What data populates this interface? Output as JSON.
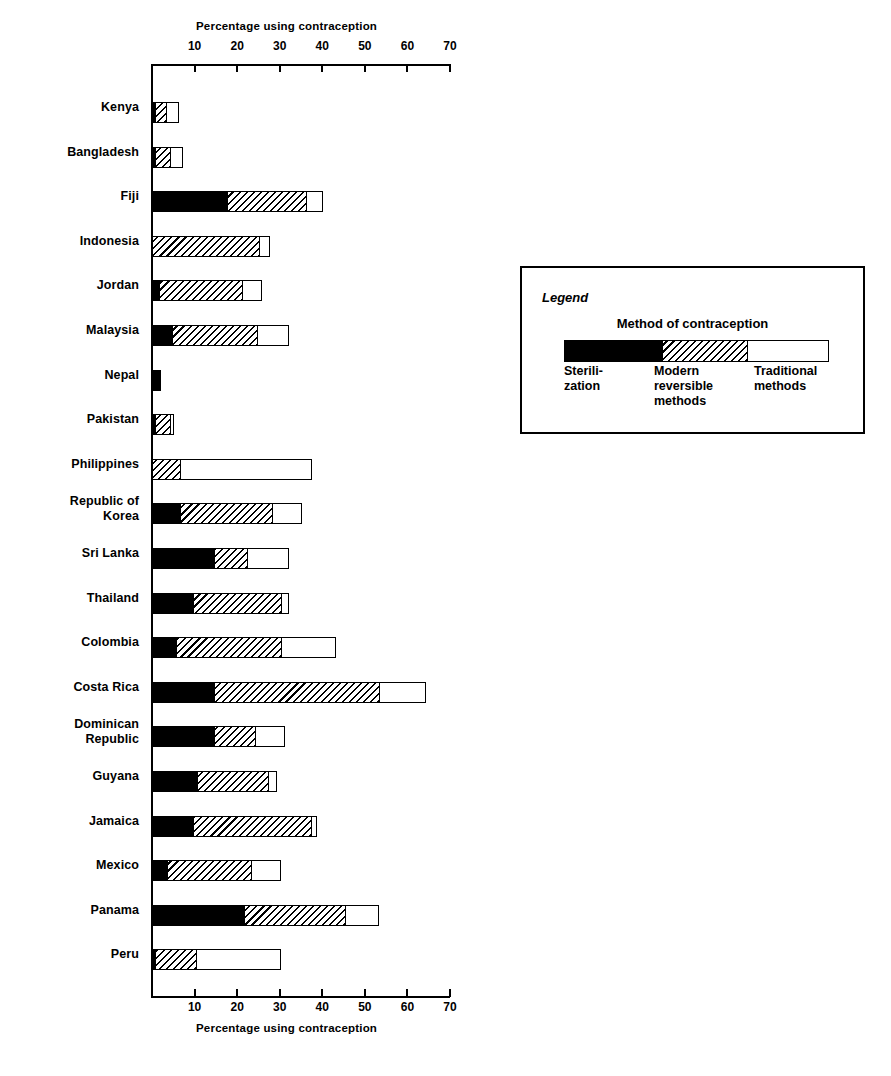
{
  "chart_data": {
    "type": "bar",
    "orientation": "horizontal",
    "stacked": true,
    "title": "",
    "xlabel": "Percentage using contraception",
    "ylabel": "",
    "xlim": [
      0,
      70
    ],
    "xticks": [
      10,
      20,
      30,
      40,
      50,
      60,
      70
    ],
    "grid": false,
    "axis_top_label": "Percentage using contraception",
    "axis_bottom_label": "Percentage using contraception",
    "categories": [
      "Kenya",
      "Bangladesh",
      "Fiji",
      "Indonesia",
      "Jordan",
      "Malaysia",
      "Nepal",
      "Pakistan",
      "Philippines",
      "Republic of\nKorea",
      "Sri Lanka",
      "Thailand",
      "Colombia",
      "Costa Rica",
      "Dominican\nRepublic",
      "Guyana",
      "Jamaica",
      "Mexico",
      "Panama",
      "Peru"
    ],
    "series": [
      {
        "name": "Sterilization",
        "color": "#000000",
        "pattern": "solid-black",
        "values": [
          1,
          1,
          18,
          0,
          2,
          5,
          2,
          1,
          0,
          7,
          15,
          10,
          6,
          15,
          15,
          11,
          10,
          4,
          22,
          1
        ]
      },
      {
        "name": "Modern reversible methods",
        "color": "#ffffff",
        "pattern": "diagonal-hatch",
        "values": [
          3,
          4,
          19,
          25.5,
          20,
          20.5,
          0,
          4,
          7,
          22,
          8,
          21,
          25,
          39,
          10,
          17,
          28,
          20,
          24,
          10
        ]
      },
      {
        "name": "Traditional methods",
        "color": "#ffffff",
        "pattern": "open-white",
        "values": [
          3,
          3,
          4,
          2.5,
          4.5,
          7.5,
          0,
          1,
          31,
          7,
          10,
          2,
          13,
          11,
          7,
          2,
          1.5,
          7,
          8,
          20
        ]
      }
    ],
    "totals": [
      7,
      8,
      41,
      28,
      26.5,
      33,
      2,
      6,
      38,
      36,
      33,
      33,
      44,
      65,
      32,
      30,
      39.5,
      31,
      54,
      31
    ]
  },
  "legend": {
    "title": "Legend",
    "subtitle": "Method of contraception",
    "items": [
      {
        "label": "Sterili-\nzation",
        "swatch": "sterilization"
      },
      {
        "label": "Modern\nreversible\nmethods",
        "swatch": "modern"
      },
      {
        "label": "Traditional\nmethods",
        "swatch": "traditional"
      }
    ]
  },
  "colors": {
    "ink": "#000000",
    "paper": "#ffffff"
  }
}
